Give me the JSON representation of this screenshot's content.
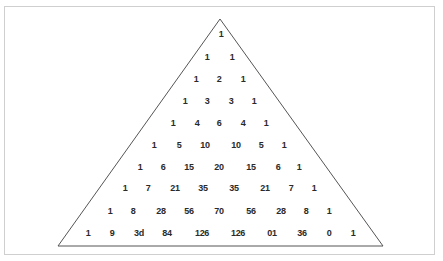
{
  "diagram": {
    "rows": [
      [
        "1"
      ],
      [
        "1",
        "1"
      ],
      [
        "1",
        "2",
        "1"
      ],
      [
        "1",
        "3",
        "3",
        "1"
      ],
      [
        "1",
        "4",
        "6",
        "4",
        "1"
      ],
      [
        "1",
        "5",
        "10",
        "10",
        "5",
        "1"
      ],
      [
        "1",
        "6",
        "15",
        "20",
        "15",
        "6",
        "1"
      ],
      [
        "1",
        "7",
        "21",
        "35",
        "35",
        "21",
        "7",
        "1"
      ],
      [
        "1",
        "8",
        "28",
        "56",
        "70",
        "56",
        "28",
        "8",
        "1"
      ],
      [
        "1",
        "9",
        "36",
        "84",
        "126",
        "126",
        "84",
        "36",
        "9",
        "1"
      ]
    ],
    "rows_as_rendered_last": [
      "1",
      "9",
      "3d",
      "84",
      "126",
      "126",
      "01",
      "36",
      "0",
      "1"
    ],
    "colors": {
      "text": "#2a2a2a",
      "triangle_stroke": "#555555",
      "frame": "#cfcfcf"
    }
  }
}
